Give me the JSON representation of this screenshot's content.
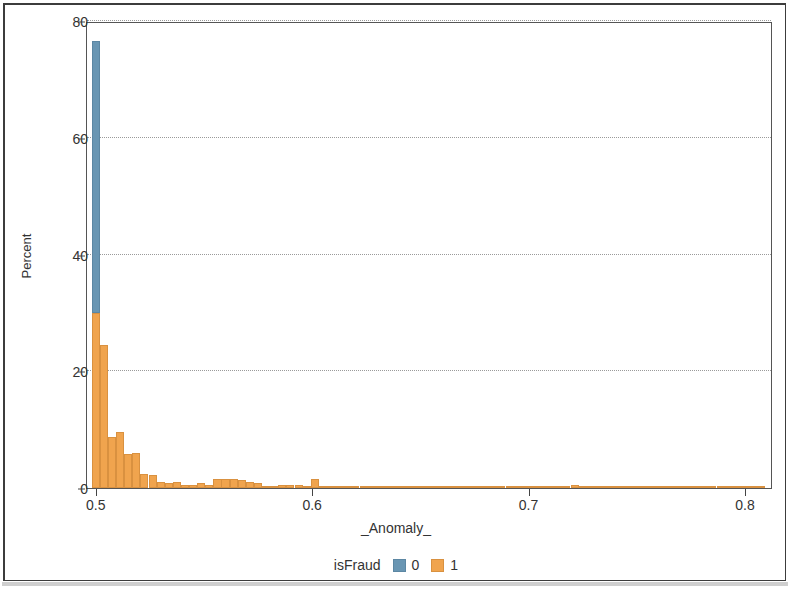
{
  "chart_data": {
    "type": "bar",
    "subtype": "stacked-histogram",
    "title": "",
    "xlabel": "_Anomaly_",
    "ylabel": "Percent",
    "xlim": [
      0.4955,
      0.8125
    ],
    "ylim": [
      0,
      80
    ],
    "xticks": [
      "0.5",
      "0.6",
      "0.7",
      "0.8"
    ],
    "xtick_values": [
      0.5,
      0.6,
      0.7,
      0.8
    ],
    "yticks": [
      "0",
      "20",
      "40",
      "60",
      "80"
    ],
    "ytick_values": [
      0,
      20,
      40,
      60,
      80
    ],
    "grid": "horizontal-dotted",
    "bin_width": 0.00375,
    "legend": {
      "title": "isFraud",
      "position": "bottom",
      "entries": [
        {
          "label": "0",
          "color": "#6996b3"
        },
        {
          "label": "1",
          "color": "#f0a44e"
        }
      ]
    },
    "series": [
      {
        "name": "0",
        "color": "#6996b3"
      },
      {
        "name": "1",
        "color": "#f0a44e"
      }
    ],
    "bins": [
      {
        "x": 0.4995,
        "isFraud_0": 46.5,
        "isFraud_1": 30.0
      },
      {
        "x": 0.5033,
        "isFraud_0": 0,
        "isFraud_1": 24.5
      },
      {
        "x": 0.507,
        "isFraud_0": 0,
        "isFraud_1": 8.8
      },
      {
        "x": 0.5108,
        "isFraud_0": 0,
        "isFraud_1": 9.6
      },
      {
        "x": 0.5145,
        "isFraud_0": 0,
        "isFraud_1": 5.9
      },
      {
        "x": 0.5183,
        "isFraud_0": 0,
        "isFraud_1": 6.0
      },
      {
        "x": 0.522,
        "isFraud_0": 0,
        "isFraud_1": 2.4
      },
      {
        "x": 0.5258,
        "isFraud_0": 0,
        "isFraud_1": 2.3
      },
      {
        "x": 0.5295,
        "isFraud_0": 0,
        "isFraud_1": 1.1
      },
      {
        "x": 0.5333,
        "isFraud_0": 0,
        "isFraud_1": 0.8
      },
      {
        "x": 0.537,
        "isFraud_0": 0,
        "isFraud_1": 1.0
      },
      {
        "x": 0.5408,
        "isFraud_0": 0,
        "isFraud_1": 0.6
      },
      {
        "x": 0.5445,
        "isFraud_0": 0,
        "isFraud_1": 0.5
      },
      {
        "x": 0.5483,
        "isFraud_0": 0,
        "isFraud_1": 0.9
      },
      {
        "x": 0.552,
        "isFraud_0": 0,
        "isFraud_1": 0.5
      },
      {
        "x": 0.5558,
        "isFraud_0": 0,
        "isFraud_1": 1.5
      },
      {
        "x": 0.5595,
        "isFraud_0": 0,
        "isFraud_1": 1.6
      },
      {
        "x": 0.5633,
        "isFraud_0": 0,
        "isFraud_1": 1.5
      },
      {
        "x": 0.567,
        "isFraud_0": 0,
        "isFraud_1": 1.3
      },
      {
        "x": 0.5708,
        "isFraud_0": 0,
        "isFraud_1": 1.1
      },
      {
        "x": 0.5745,
        "isFraud_0": 0,
        "isFraud_1": 0.9
      },
      {
        "x": 0.5783,
        "isFraud_0": 0,
        "isFraud_1": 0.4
      },
      {
        "x": 0.582,
        "isFraud_0": 0,
        "isFraud_1": 0.3
      },
      {
        "x": 0.5858,
        "isFraud_0": 0,
        "isFraud_1": 0.5
      },
      {
        "x": 0.5895,
        "isFraud_0": 0,
        "isFraud_1": 0.6
      },
      {
        "x": 0.5933,
        "isFraud_0": 0,
        "isFraud_1": 0.5
      },
      {
        "x": 0.597,
        "isFraud_0": 0,
        "isFraud_1": 0.3
      },
      {
        "x": 0.6008,
        "isFraud_0": 0,
        "isFraud_1": 1.6
      },
      {
        "x": 0.6045,
        "isFraud_0": 0,
        "isFraud_1": 0.3
      },
      {
        "x": 0.6083,
        "isFraud_0": 0,
        "isFraud_1": 0.2
      },
      {
        "x": 0.612,
        "isFraud_0": 0,
        "isFraud_1": 0.2
      },
      {
        "x": 0.6158,
        "isFraud_0": 0,
        "isFraud_1": 0.15
      },
      {
        "x": 0.6195,
        "isFraud_0": 0,
        "isFraud_1": 0.2
      },
      {
        "x": 0.6233,
        "isFraud_0": 0,
        "isFraud_1": 0.15
      },
      {
        "x": 0.627,
        "isFraud_0": 0,
        "isFraud_1": 0.2
      },
      {
        "x": 0.6308,
        "isFraud_0": 0,
        "isFraud_1": 0.15
      },
      {
        "x": 0.6345,
        "isFraud_0": 0,
        "isFraud_1": 0.25
      },
      {
        "x": 0.6383,
        "isFraud_0": 0,
        "isFraud_1": 0.2
      },
      {
        "x": 0.642,
        "isFraud_0": 0,
        "isFraud_1": 0.15
      },
      {
        "x": 0.6458,
        "isFraud_0": 0,
        "isFraud_1": 0.25
      },
      {
        "x": 0.6495,
        "isFraud_0": 0,
        "isFraud_1": 0.3
      },
      {
        "x": 0.6533,
        "isFraud_0": 0,
        "isFraud_1": 0.25
      },
      {
        "x": 0.657,
        "isFraud_0": 0,
        "isFraud_1": 0.3
      },
      {
        "x": 0.6608,
        "isFraud_0": 0,
        "isFraud_1": 0.2
      },
      {
        "x": 0.6645,
        "isFraud_0": 0,
        "isFraud_1": 0.15
      },
      {
        "x": 0.6683,
        "isFraud_0": 0,
        "isFraud_1": 0.1
      },
      {
        "x": 0.672,
        "isFraud_0": 0,
        "isFraud_1": 0.15
      },
      {
        "x": 0.6758,
        "isFraud_0": 0,
        "isFraud_1": 0.1
      },
      {
        "x": 0.6795,
        "isFraud_0": 0,
        "isFraud_1": 0.15
      },
      {
        "x": 0.6833,
        "isFraud_0": 0,
        "isFraud_1": 0.2
      },
      {
        "x": 0.687,
        "isFraud_0": 0,
        "isFraud_1": 0.15
      },
      {
        "x": 0.6908,
        "isFraud_0": 0,
        "isFraud_1": 0.1
      },
      {
        "x": 0.6945,
        "isFraud_0": 0,
        "isFraud_1": 0.15
      },
      {
        "x": 0.6983,
        "isFraud_0": 0,
        "isFraud_1": 0.1
      },
      {
        "x": 0.702,
        "isFraud_0": 0,
        "isFraud_1": 0.1
      },
      {
        "x": 0.7058,
        "isFraud_0": 0,
        "isFraud_1": 0.1
      },
      {
        "x": 0.7095,
        "isFraud_0": 0,
        "isFraud_1": 0.05
      },
      {
        "x": 0.7133,
        "isFraud_0": 0,
        "isFraud_1": 0.1
      },
      {
        "x": 0.717,
        "isFraud_0": 0,
        "isFraud_1": 0.05
      },
      {
        "x": 0.7208,
        "isFraud_0": 0,
        "isFraud_1": 0.45
      },
      {
        "x": 0.7245,
        "isFraud_0": 0,
        "isFraud_1": 0.3
      },
      {
        "x": 0.7283,
        "isFraud_0": 0,
        "isFraud_1": 0.05
      },
      {
        "x": 0.732,
        "isFraud_0": 0,
        "isFraud_1": 0.05
      },
      {
        "x": 0.7358,
        "isFraud_0": 0,
        "isFraud_1": 0.1
      },
      {
        "x": 0.7395,
        "isFraud_0": 0,
        "isFraud_1": 0.05
      },
      {
        "x": 0.7433,
        "isFraud_0": 0,
        "isFraud_1": 0.05
      },
      {
        "x": 0.747,
        "isFraud_0": 0,
        "isFraud_1": 0.3
      },
      {
        "x": 0.7508,
        "isFraud_0": 0,
        "isFraud_1": 0.25
      },
      {
        "x": 0.7545,
        "isFraud_0": 0,
        "isFraud_1": 0.05
      },
      {
        "x": 0.7583,
        "isFraud_0": 0,
        "isFraud_1": 0.05
      },
      {
        "x": 0.762,
        "isFraud_0": 0,
        "isFraud_1": 0.05
      },
      {
        "x": 0.7658,
        "isFraud_0": 0,
        "isFraud_1": 0.05
      },
      {
        "x": 0.7695,
        "isFraud_0": 0,
        "isFraud_1": 0.05
      },
      {
        "x": 0.7733,
        "isFraud_0": 0,
        "isFraud_1": 0.1
      },
      {
        "x": 0.777,
        "isFraud_0": 0,
        "isFraud_1": 0.05
      },
      {
        "x": 0.7808,
        "isFraud_0": 0,
        "isFraud_1": 0.4
      },
      {
        "x": 0.7845,
        "isFraud_0": 0,
        "isFraud_1": 0.35
      },
      {
        "x": 0.7883,
        "isFraud_0": 0,
        "isFraud_1": 0.05
      },
      {
        "x": 0.792,
        "isFraud_0": 0,
        "isFraud_1": 0.05
      },
      {
        "x": 0.7958,
        "isFraud_0": 0,
        "isFraud_1": 0.05
      },
      {
        "x": 0.7995,
        "isFraud_0": 0,
        "isFraud_1": 0.05
      },
      {
        "x": 0.8033,
        "isFraud_0": 0,
        "isFraud_1": 0.05
      },
      {
        "x": 0.807,
        "isFraud_0": 0,
        "isFraud_1": 0.05
      }
    ]
  }
}
